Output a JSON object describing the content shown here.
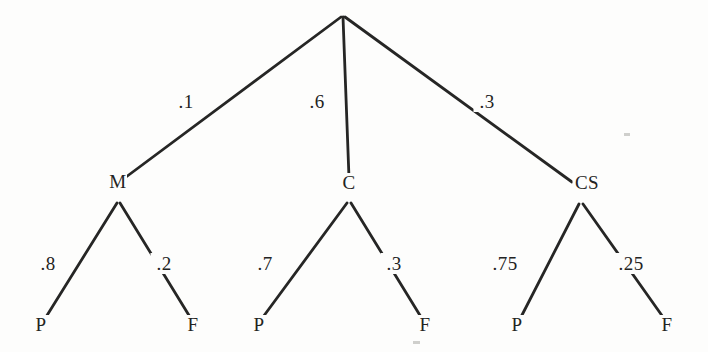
{
  "figure": {
    "background_color": "#fdfdfc",
    "ink_color": "#262625",
    "width": 708,
    "height": 352
  },
  "chart_data": {
    "type": "diagram",
    "subtype": "probability-tree",
    "title": "",
    "root": {
      "label": "",
      "x": 342,
      "y": 14
    },
    "levels": 3,
    "nodes": [
      {
        "id": "root",
        "label": "",
        "x": 342,
        "y": 14,
        "level": 0
      },
      {
        "id": "M",
        "label": "M",
        "x": 118,
        "y": 188,
        "vx": 118,
        "vy": 202,
        "level": 1
      },
      {
        "id": "C",
        "label": "C",
        "x": 349,
        "y": 189,
        "vx": 349,
        "vy": 202,
        "level": 1
      },
      {
        "id": "CS",
        "label": "CS",
        "x": 587,
        "y": 189,
        "vx": 581,
        "vy": 203,
        "level": 1
      },
      {
        "id": "M-P",
        "label": "P",
        "x": 41,
        "y": 331,
        "level": 2
      },
      {
        "id": "M-F",
        "label": "F",
        "x": 193,
        "y": 331,
        "level": 2
      },
      {
        "id": "C-P",
        "label": "P",
        "x": 259,
        "y": 331,
        "level": 2
      },
      {
        "id": "C-F",
        "label": "F",
        "x": 425,
        "y": 331,
        "level": 2
      },
      {
        "id": "CS-P",
        "label": "P",
        "x": 517,
        "y": 331,
        "level": 2
      },
      {
        "id": "CS-F",
        "label": "F",
        "x": 667,
        "y": 331,
        "level": 2
      }
    ],
    "edges": [
      {
        "id": "root-M",
        "from": "root",
        "to": "M",
        "x1": 341,
        "y1": 17,
        "x2": 122,
        "y2": 180,
        "label": ".1",
        "value": 0.1,
        "lx": 186,
        "ly": 108
      },
      {
        "id": "root-C",
        "from": "root",
        "to": "C",
        "x1": 343,
        "y1": 17,
        "x2": 349,
        "y2": 178,
        "label": ".6",
        "value": 0.6,
        "lx": 317,
        "ly": 108
      },
      {
        "id": "root-CS",
        "from": "root",
        "to": "CS",
        "x1": 345,
        "y1": 17,
        "x2": 572,
        "y2": 182,
        "label": ".3",
        "value": 0.3,
        "lx": 487,
        "ly": 108
      },
      {
        "id": "M-P-edge",
        "from": "M",
        "to": "M-P",
        "x1": 117,
        "y1": 203,
        "x2": 46,
        "y2": 317,
        "label": ".8",
        "value": 0.8,
        "lx": 48,
        "ly": 270
      },
      {
        "id": "M-F-edge",
        "from": "M",
        "to": "M-F",
        "x1": 120,
        "y1": 203,
        "x2": 190,
        "y2": 317,
        "label": ".2",
        "value": 0.2,
        "lx": 164,
        "ly": 270
      },
      {
        "id": "C-P-edge",
        "from": "C",
        "to": "C-P",
        "x1": 347,
        "y1": 203,
        "x2": 263,
        "y2": 317,
        "label": ".7",
        "value": 0.7,
        "lx": 265,
        "ly": 270
      },
      {
        "id": "C-F-edge",
        "from": "C",
        "to": "C-F",
        "x1": 351,
        "y1": 203,
        "x2": 421,
        "y2": 317,
        "label": ".3",
        "value": 0.3,
        "lx": 394,
        "ly": 270
      },
      {
        "id": "CS-P-edge",
        "from": "CS",
        "to": "CS-P",
        "x1": 579,
        "y1": 204,
        "x2": 521,
        "y2": 317,
        "label": ".75",
        "value": 0.75,
        "lx": 505,
        "ly": 270
      },
      {
        "id": "CS-F-edge",
        "from": "CS",
        "to": "CS-F",
        "x1": 583,
        "y1": 204,
        "x2": 663,
        "y2": 317,
        "label": ".25",
        "value": 0.25,
        "lx": 631,
        "ly": 270
      }
    ],
    "branch_groups": [
      {
        "parent": "root",
        "children": [
          "M",
          "C",
          "CS"
        ],
        "probabilities": [
          0.1,
          0.6,
          0.3
        ]
      },
      {
        "parent": "M",
        "children": [
          "M-P",
          "M-F"
        ],
        "probabilities": [
          0.8,
          0.2
        ]
      },
      {
        "parent": "C",
        "children": [
          "C-P",
          "C-F"
        ],
        "probabilities": [
          0.7,
          0.3
        ]
      },
      {
        "parent": "CS",
        "children": [
          "CS-P",
          "CS-F"
        ],
        "probabilities": [
          0.75,
          0.25
        ]
      }
    ],
    "legend": [],
    "annotations": [],
    "xlabel": "",
    "ylabel": ""
  },
  "specks": [
    {
      "x": 624,
      "y": 133,
      "w": 6,
      "h": 3
    },
    {
      "x": 413,
      "y": 341,
      "w": 7,
      "h": 3
    }
  ]
}
